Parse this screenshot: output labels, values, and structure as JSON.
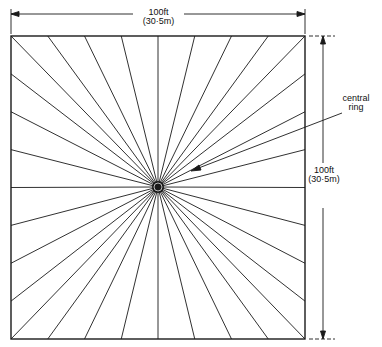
{
  "diagram": {
    "type": "radial-plan",
    "stroke_color": "#1a1a1a",
    "background": "#ffffff",
    "square": {
      "left": 11,
      "top": 36,
      "right": 305,
      "bottom": 339
    },
    "center": {
      "x": 158,
      "y": 187,
      "ring_radius": 6
    },
    "divisions_per_side": 8
  },
  "dimensions": {
    "width": {
      "primary": "100ft",
      "secondary": "(30·5m)"
    },
    "height": {
      "primary": "100ft",
      "secondary": "(30·5m)"
    }
  },
  "annotations": {
    "central_ring": {
      "line1": "central",
      "line2": "ring"
    }
  }
}
